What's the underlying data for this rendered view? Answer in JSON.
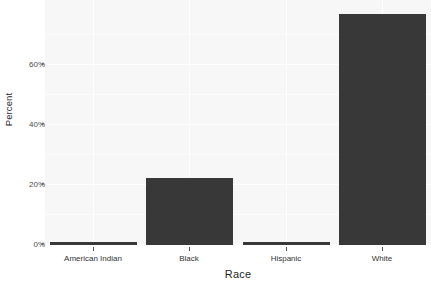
{
  "chart_data": {
    "type": "bar",
    "title": "",
    "subtitle": "",
    "xlabel": "Race",
    "ylabel": "Percent",
    "categories": [
      "American Indian",
      "Black",
      "Hispanic",
      "White"
    ],
    "values": [
      0.6,
      22.3,
      0.8,
      77.0
    ],
    "value_labels": [
      "0.6%",
      "22.3%",
      "0.8%",
      "77%"
    ],
    "series": [
      {
        "name": "Percent",
        "values": [
          0.6,
          22.3,
          0.8,
          77.0
        ]
      }
    ],
    "ylim": [
      0,
      78
    ],
    "xlim": [
      0,
      4
    ],
    "y_ticks": [
      0,
      20,
      40,
      60
    ],
    "y_tick_labels": [
      "0%",
      "20%",
      "40%",
      "60%"
    ],
    "x_tick_labels": [
      "American Indian",
      "Black",
      "Hispanic",
      "White"
    ],
    "grid": true,
    "legend": "none",
    "bar_color": "#383838",
    "panel_color": "#f7f7f7",
    "grid_color": "#fdfdfd",
    "axis_text_color": "#4a4a4a",
    "orientation": "vertical"
  },
  "axis": {
    "y_title": "Percent",
    "x_title": "Race"
  }
}
